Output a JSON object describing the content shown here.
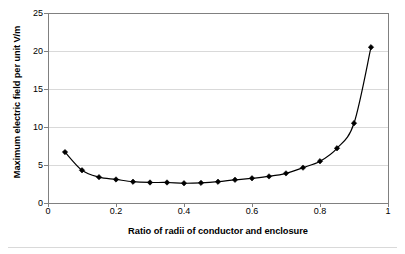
{
  "chart_data": {
    "type": "line",
    "title": "",
    "subtitle": "",
    "xlabel": "Ratio of radii of conductor and enclosure",
    "ylabel": "Maximum electric field per unit V/m",
    "xlim": [
      0,
      1
    ],
    "ylim": [
      0,
      25
    ],
    "xticks": [
      "0",
      "0.2",
      "0.4",
      "0.6",
      "0.8",
      "1"
    ],
    "xtick_values": [
      0,
      0.2,
      0.4,
      0.6,
      0.8,
      1
    ],
    "yticks": [
      "0",
      "5",
      "10",
      "15",
      "20",
      "25"
    ],
    "ytick_values": [
      0,
      5,
      10,
      15,
      20,
      25
    ],
    "grid": "horizontal",
    "grid_color": "#d9d9d9",
    "legend": "none",
    "marker": "diamond",
    "marker_color": "#000000",
    "line_color": "#000000",
    "series": [
      {
        "name": "Maximum electric field per unit V/m",
        "x": [
          0.05,
          0.1,
          0.15,
          0.2,
          0.25,
          0.3,
          0.35,
          0.4,
          0.45,
          0.5,
          0.55,
          0.6,
          0.65,
          0.7,
          0.75,
          0.8,
          0.85,
          0.9,
          0.95
        ],
        "values": [
          6.7,
          4.3,
          3.4,
          3.1,
          2.8,
          2.7,
          2.7,
          2.6,
          2.65,
          2.8,
          3.05,
          3.25,
          3.5,
          3.9,
          4.65,
          5.5,
          7.2,
          10.5,
          20.5
        ]
      }
    ]
  },
  "axes": {
    "frame_color": "#808080",
    "tick_color": "#808080"
  }
}
